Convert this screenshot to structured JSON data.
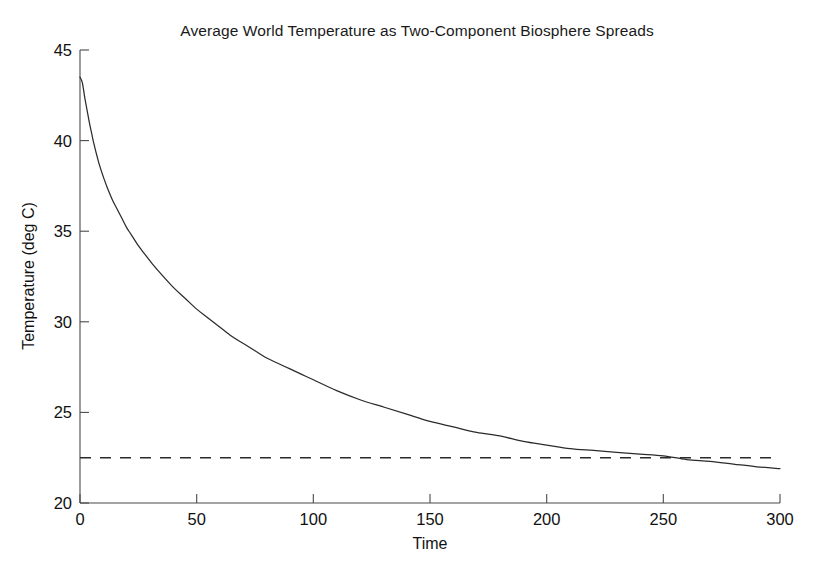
{
  "chart_data": {
    "type": "line",
    "title": "Average World Temperature as Two-Component Biosphere Spreads",
    "xlabel": "Time",
    "ylabel": "Temperature (deg C)",
    "xlim": [
      0,
      300
    ],
    "ylim": [
      20,
      45
    ],
    "xticks": [
      0,
      50,
      100,
      150,
      200,
      250,
      300
    ],
    "yticks": [
      20,
      25,
      30,
      35,
      40,
      45
    ],
    "xtick_labels": [
      "0",
      "50",
      "100",
      "150",
      "200",
      "250",
      "300"
    ],
    "ytick_labels": [
      "20",
      "25",
      "30",
      "35",
      "40",
      "45"
    ],
    "grid": false,
    "legend": "none",
    "series": [
      {
        "name": "Average world temperature",
        "style": "solid",
        "color": "#2b2b2b",
        "x": [
          0,
          1,
          2,
          3,
          4,
          5,
          6,
          8,
          10,
          12,
          14,
          16,
          18,
          20,
          22,
          25,
          28,
          31,
          35,
          40,
          45,
          50,
          55,
          60,
          65,
          70,
          75,
          80,
          85,
          90,
          95,
          100,
          110,
          120,
          130,
          140,
          150,
          160,
          170,
          180,
          190,
          200,
          210,
          220,
          230,
          240,
          250,
          260,
          270,
          280,
          290,
          300
        ],
        "y": [
          43.5,
          43.2,
          42.4,
          41.7,
          41.0,
          40.4,
          39.8,
          38.8,
          38.0,
          37.3,
          36.7,
          36.2,
          35.7,
          35.2,
          34.8,
          34.2,
          33.7,
          33.2,
          32.6,
          31.9,
          31.3,
          30.7,
          30.2,
          29.7,
          29.2,
          28.8,
          28.4,
          28.0,
          27.7,
          27.4,
          27.1,
          26.8,
          26.2,
          25.7,
          25.3,
          24.9,
          24.5,
          24.2,
          23.9,
          23.7,
          23.4,
          23.2,
          23.0,
          22.9,
          22.8,
          22.7,
          22.6,
          22.4,
          22.3,
          22.15,
          22.0,
          21.9
        ]
      },
      {
        "name": "Equilibrium reference temperature",
        "style": "dashed",
        "color": "#2b2b2b",
        "constant_value": 22.5,
        "x": [
          0,
          300
        ],
        "y": [
          22.5,
          22.5
        ]
      }
    ],
    "annotations": [
      {
        "text": "solid curve crosses dashed reference near Time = 255",
        "x": 255,
        "y": 22.5
      }
    ]
  }
}
